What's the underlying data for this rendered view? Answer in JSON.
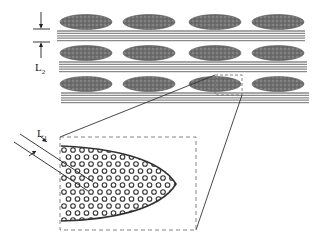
{
  "diagram": {
    "type": "schematic cross-section",
    "labels": {
      "l2": {
        "main": "L",
        "sub": "2"
      },
      "l1": {
        "main": "L",
        "sub": "1"
      }
    },
    "colors": {
      "ellipse_fill": "#6b6b6b",
      "band_line": "#8a8a8a",
      "outline": "#333333",
      "dashed": "#777777",
      "particle": "#333333"
    },
    "layers": {
      "rows": 3,
      "ellipses_per_row": 4,
      "ellipse_centers_x": [
        86,
        149,
        215,
        278
      ],
      "ellipse_rows_y": [
        22,
        53,
        84
      ],
      "band_rows_y": [
        31,
        62,
        93
      ]
    },
    "inset": {
      "description": "magnified view of single ellipsoid filled with circular particles",
      "box": {
        "x": 60,
        "y": 137,
        "w": 136,
        "h": 93
      }
    }
  }
}
